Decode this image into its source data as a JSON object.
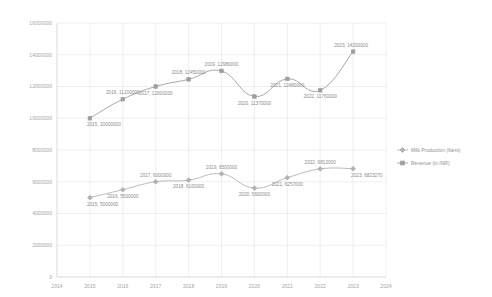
{
  "chart_data": {
    "type": "line",
    "title": "",
    "subtitle": "",
    "xlabel": "",
    "ylabel": "",
    "x": [
      2015,
      2016,
      2017,
      2018,
      2019,
      2020,
      2021,
      2022,
      2023
    ],
    "categories": [
      "2015",
      "2016",
      "2017",
      "2018",
      "2019",
      "2020",
      "2021",
      "2022",
      "2023"
    ],
    "xlim": [
      2014,
      2024
    ],
    "ylim": [
      0,
      16000000
    ],
    "grid": true,
    "legend_position": "right",
    "x_tick_labels": [
      "2014",
      "2015",
      "2016",
      "2017",
      "2018",
      "2019",
      "2020",
      "2021",
      "2022",
      "2023",
      "2024"
    ],
    "y_tick_labels": [
      "0",
      "2000000",
      "4000000",
      "6000000",
      "8000000",
      "10000000",
      "12000000",
      "14000000",
      "16000000"
    ],
    "y_ticks": [
      0,
      2000000,
      4000000,
      6000000,
      8000000,
      10000000,
      12000000,
      14000000,
      16000000
    ],
    "series": [
      {
        "name": "Milk Production (liters)",
        "color": "#b3b3b3",
        "marker": "diamond",
        "values": [
          5000000,
          5500000,
          6000000,
          6100000,
          6500000,
          5600000,
          6257000,
          6812000,
          6823270
        ],
        "point_labels": [
          "2015, 5000000",
          "2016, 5500000",
          "2017, 6000000",
          "2018, 6100000",
          "2019, 6500000",
          "2020, 5600000",
          "2021, 6257000",
          "2022, 6812000",
          "2023, 6823270"
        ],
        "label_placement": [
          "below",
          "below",
          "above",
          "below",
          "above",
          "below",
          "below",
          "above",
          "below"
        ]
      },
      {
        "name": "Revenue (in INR)",
        "color": "#9e9e9e",
        "marker": "square",
        "values": [
          10000000,
          11200000,
          12000000,
          12450000,
          12980000,
          11370000,
          12480000,
          11760000,
          14200000
        ],
        "point_labels": [
          "2015, 10000000",
          "2016, 11200000",
          "2017, 12000000",
          "2018, 12450000",
          "2019, 12980000",
          "2020, 11370000",
          "2021, 12480000",
          "2022, 11760000",
          "2023, 14200000"
        ],
        "label_placement": [
          "below",
          "above",
          "below",
          "above",
          "above",
          "below",
          "below",
          "below",
          "above"
        ]
      }
    ]
  },
  "legend": {
    "items": [
      {
        "label": "Milk Production (liters)",
        "marker": "diamond",
        "color": "#b3b3b3"
      },
      {
        "label": "Revenue (in INR)",
        "marker": "square",
        "color": "#9e9e9e"
      }
    ]
  }
}
